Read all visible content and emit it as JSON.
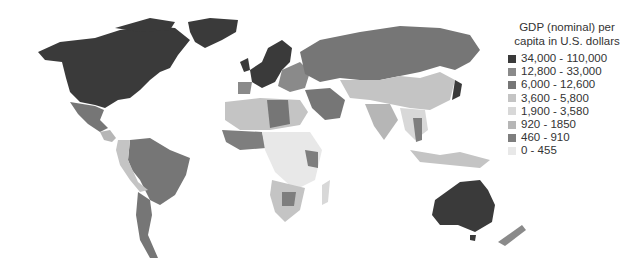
{
  "legend": {
    "title_line1": "GDP (nominal) per",
    "title_line2": "capita in U.S. dollars",
    "items": [
      {
        "label": "34,000 - 110,000",
        "color": "#3a3a3a"
      },
      {
        "label": "12,800 - 33,000",
        "color": "#8a8a8a"
      },
      {
        "label": "6,000 - 12,600",
        "color": "#767676"
      },
      {
        "label": "3,600 - 5,800",
        "color": "#c4c4c4"
      },
      {
        "label": "1,900 - 3,580",
        "color": "#d8d8d8"
      },
      {
        "label": "920 - 1850",
        "color": "#b6b6b6"
      },
      {
        "label": "460 - 910",
        "color": "#7e7e7e"
      },
      {
        "label": "0 - 455",
        "color": "#e8e8e8"
      }
    ]
  },
  "regions": [
    {
      "name": "north-america",
      "class": "34,000 - 110,000"
    },
    {
      "name": "greenland",
      "class": "34,000 - 110,000"
    },
    {
      "name": "mexico",
      "class": "6,000 - 12,600"
    },
    {
      "name": "central-america",
      "class": "920 - 1850"
    },
    {
      "name": "south-america-brazil-argentina",
      "class": "6,000 - 12,600"
    },
    {
      "name": "andes-west",
      "class": "3,600 - 5,800"
    },
    {
      "name": "western-europe",
      "class": "34,000 - 110,000"
    },
    {
      "name": "eastern-europe",
      "class": "12,800 - 33,000"
    },
    {
      "name": "russia",
      "class": "6,000 - 12,600"
    },
    {
      "name": "north-africa",
      "class": "3,600 - 5,800"
    },
    {
      "name": "libya",
      "class": "6,000 - 12,600"
    },
    {
      "name": "sub-saharan-africa",
      "class": "0 - 455"
    },
    {
      "name": "west-africa",
      "class": "460 - 910"
    },
    {
      "name": "southern-africa",
      "class": "3,600 - 5,800"
    },
    {
      "name": "middle-east",
      "class": "6,000 - 12,600"
    },
    {
      "name": "china-central-asia",
      "class": "3,600 - 5,800"
    },
    {
      "name": "india",
      "class": "920 - 1850"
    },
    {
      "name": "japan",
      "class": "34,000 - 110,000"
    },
    {
      "name": "southeast-asia",
      "class": "1,900 - 3,580"
    },
    {
      "name": "australia",
      "class": "34,000 - 110,000"
    },
    {
      "name": "new-zealand",
      "class": "12,800 - 33,000"
    }
  ]
}
